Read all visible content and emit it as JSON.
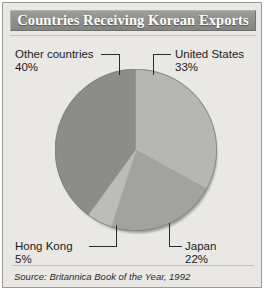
{
  "figure": {
    "title": "Countries Receiving Korean Exports",
    "source": "Source: Britannica Book of the Year,  1992",
    "panel_color": "#e9e8e5",
    "border_color": "#9a9a97",
    "banner_color": "#8d8d8a",
    "title_color": "#fdfdfc"
  },
  "labels": {
    "other": {
      "name": "Other countries",
      "pct": "40%"
    },
    "united_states": {
      "name": "United States",
      "pct": "33%"
    },
    "hong_kong": {
      "name": "Hong Kong",
      "pct": "5%"
    },
    "japan": {
      "name": "Japan",
      "pct": "22%"
    }
  },
  "chart_data": {
    "type": "pie",
    "title": "Countries Receiving Korean Exports",
    "subtitle": "",
    "xlabel": "",
    "ylabel": "",
    "units": "percent of Korean exports",
    "source": "Source: Britannica Book of the Year,  1992",
    "legend_position": "none (direct labels with leader lines)",
    "grid": false,
    "start_angle_deg": 0,
    "direction": "clockwise",
    "total": 100,
    "categories": [
      "United States",
      "Japan",
      "Hong Kong",
      "Other countries"
    ],
    "values": [
      33,
      22,
      5,
      40
    ],
    "slices": [
      {
        "label": "United States",
        "value": 33,
        "pct_text": "33%",
        "color": "#b6b6b3",
        "start_angle_deg": 0,
        "end_angle_deg": 118.8,
        "label_position": "upper-right"
      },
      {
        "label": "Japan",
        "value": 22,
        "pct_text": "22%",
        "color": "#a2a29f",
        "start_angle_deg": 118.8,
        "end_angle_deg": 198.0,
        "label_position": "lower-right"
      },
      {
        "label": "Hong Kong",
        "value": 5,
        "pct_text": "5%",
        "color": "#bcbcb9",
        "start_angle_deg": 198.0,
        "end_angle_deg": 216.0,
        "label_position": "lower-left"
      },
      {
        "label": "Other countries",
        "value": 40,
        "pct_text": "40%",
        "color": "#8c8c89",
        "start_angle_deg": 216.0,
        "end_angle_deg": 360.0,
        "label_position": "upper-left"
      }
    ]
  }
}
